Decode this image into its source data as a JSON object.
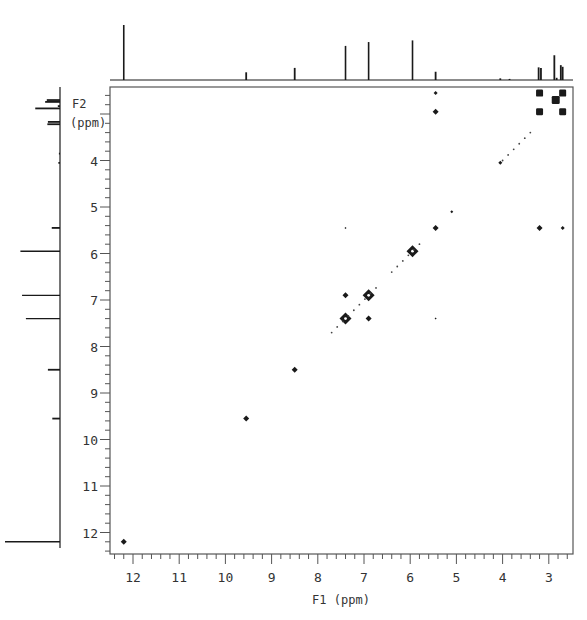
{
  "chart_data": {
    "type": "scatter",
    "title": "",
    "subtitle": "2D COSY NMR spectrum",
    "xlabel": "F1 (ppm)",
    "ylabel": "F2 (ppm)",
    "ylabel_lines": [
      "F2",
      "(ppm)"
    ],
    "xlim": [
      12.45,
      2.6
    ],
    "ylim": [
      2.35,
      12.45
    ],
    "x_ticks": [
      12,
      11,
      10,
      9,
      8,
      7,
      6,
      5,
      4,
      3
    ],
    "y_ticks": [
      4,
      5,
      6,
      7,
      8,
      9,
      10,
      11,
      12
    ],
    "grid": false,
    "legend": null,
    "projection_1d": {
      "description": "1D proton spectrum projected on top (F1) and left (F2)",
      "peaks": [
        {
          "ppm": 12.2,
          "height": 1.0
        },
        {
          "ppm": 9.55,
          "height": 0.14
        },
        {
          "ppm": 8.5,
          "height": 0.22
        },
        {
          "ppm": 7.4,
          "height": 0.62
        },
        {
          "ppm": 6.9,
          "height": 0.69
        },
        {
          "ppm": 5.95,
          "height": 0.72
        },
        {
          "ppm": 5.45,
          "height": 0.15
        },
        {
          "ppm": 4.05,
          "height": 0.03
        },
        {
          "ppm": 3.85,
          "height": 0.02
        },
        {
          "ppm": 3.22,
          "height": 0.23
        },
        {
          "ppm": 3.17,
          "height": 0.22
        },
        {
          "ppm": 2.88,
          "height": 0.45
        },
        {
          "ppm": 2.83,
          "height": 0.04
        },
        {
          "ppm": 2.74,
          "height": 0.27
        },
        {
          "ppm": 2.7,
          "height": 0.24
        }
      ]
    },
    "series": [
      {
        "name": "diagonal peaks",
        "points": [
          {
            "f1": 12.2,
            "f2": 12.2,
            "size": 3
          },
          {
            "f1": 9.55,
            "f2": 9.55,
            "size": 3
          },
          {
            "f1": 8.5,
            "f2": 8.5,
            "size": 3
          },
          {
            "f1": 7.4,
            "f2": 7.4,
            "size": 5
          },
          {
            "f1": 6.9,
            "f2": 6.9,
            "size": 5
          },
          {
            "f1": 5.95,
            "f2": 5.95,
            "size": 5
          },
          {
            "f1": 5.45,
            "f2": 5.45,
            "size": 3
          },
          {
            "f1": 5.1,
            "f2": 5.1,
            "size": 1.5
          },
          {
            "f1": 4.05,
            "f2": 4.05,
            "size": 2
          },
          {
            "f1": 2.85,
            "f2": 2.7,
            "size": 4
          }
        ]
      },
      {
        "name": "cross peaks",
        "points": [
          {
            "f1": 7.4,
            "f2": 6.9,
            "size": 3
          },
          {
            "f1": 6.9,
            "f2": 7.4,
            "size": 3
          },
          {
            "f1": 5.45,
            "f2": 2.55,
            "size": 2
          },
          {
            "f1": 5.45,
            "f2": 2.95,
            "size": 3
          },
          {
            "f1": 3.2,
            "f2": 2.55,
            "size": 3.5
          },
          {
            "f1": 2.7,
            "f2": 2.55,
            "size": 3.5
          },
          {
            "f1": 3.2,
            "f2": 2.95,
            "size": 3.5
          },
          {
            "f1": 2.7,
            "f2": 2.95,
            "size": 3.5
          },
          {
            "f1": 3.2,
            "f2": 5.45,
            "size": 3
          },
          {
            "f1": 2.7,
            "f2": 5.45,
            "size": 2
          },
          {
            "f1": 7.4,
            "f2": 5.45,
            "size": 1
          },
          {
            "f1": 5.45,
            "f2": 7.4,
            "size": 1
          }
        ]
      }
    ]
  },
  "axes": {
    "x_title": "F1 (ppm)",
    "y_title_line1": "F2",
    "y_title_line2": "(ppm)"
  },
  "colors": {
    "ink": "#1a1a1a",
    "frame": "#555555",
    "background": "#ffffff"
  }
}
